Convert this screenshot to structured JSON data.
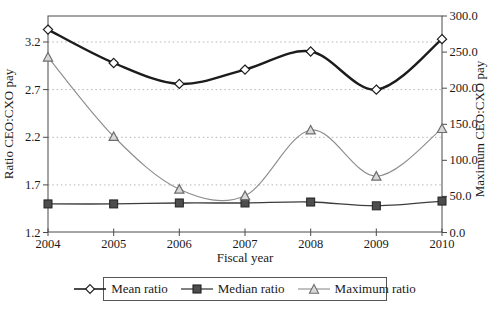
{
  "window": {
    "width": 498,
    "height": 313,
    "background": "#ffffff"
  },
  "colors": {
    "frame": "#4a4a4a",
    "text": "#1a1a1a",
    "gridline": "#b5b5b5",
    "mean_line": "#1c1c1c",
    "median_line": "#3d3d3d",
    "median_fill": "#4d4d4d",
    "max_line": "#8c8c8c",
    "triangle_fill": "#d9d9d9",
    "triangle_stroke": "#6e6e6e",
    "marker_open_fill": "#ffffff"
  },
  "chart_data": {
    "type": "line",
    "x": [
      2004,
      2005,
      2006,
      2007,
      2008,
      2009,
      2010
    ],
    "x_tick_labels": [
      "2004",
      "2005",
      "2006",
      "2007",
      "2008",
      "2009",
      "2010"
    ],
    "xlabel": "Fiscal year",
    "left_axis": {
      "label": "Ratio CEO:CXO pay",
      "ylim": [
        1.2,
        3.2
      ],
      "tick_step": 0.5,
      "tick_labels": [
        "1.2",
        "1.7",
        "2.2",
        "2.7",
        "3.2"
      ]
    },
    "right_axis": {
      "label": "Maximum CEO:CXO pay",
      "ylim": [
        0,
        300
      ],
      "tick_step": 50,
      "tick_labels": [
        "0.0",
        "50.0",
        "100.0",
        "150.0",
        "200.0",
        "250.0",
        "300.0"
      ]
    },
    "grid": {
      "style": "horizontal dotted lines at left-axis ticks",
      "at_left_values": [
        1.7,
        2.2,
        2.7,
        3.2
      ]
    },
    "legend_position": "bottom-center-boxed",
    "series": [
      {
        "name": "Mean ratio",
        "axis": "left",
        "marker": "open-diamond",
        "line_width": 2.4,
        "color": "#1c1c1c",
        "values": [
          3.33,
          2.98,
          2.76,
          2.91,
          3.1,
          2.7,
          3.23
        ]
      },
      {
        "name": "Median ratio",
        "axis": "left",
        "marker": "filled-square",
        "line_width": 1.3,
        "color": "#3d3d3d",
        "values": [
          1.5,
          1.5,
          1.51,
          1.51,
          1.52,
          1.48,
          1.53
        ]
      },
      {
        "name": "Maximum ratio",
        "axis": "right",
        "marker": "open-triangle",
        "line_width": 1.1,
        "color": "#8c8c8c",
        "values": [
          243,
          133,
          60,
          51,
          142,
          78,
          144
        ]
      }
    ]
  }
}
